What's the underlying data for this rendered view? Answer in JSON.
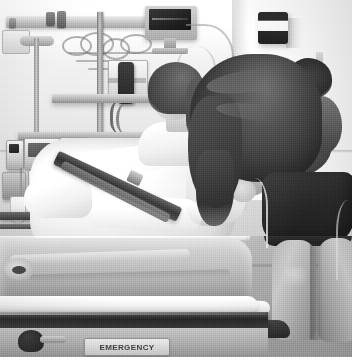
{
  "image": {
    "kind": "photograph",
    "medium": "black-and-white grainy print",
    "setting": "hospital emergency room / trauma bay",
    "orientation": "portrait",
    "width_px": 358,
    "height_px": 363,
    "palette": {
      "paper_white": "#ffffff",
      "wall_light": "#f3f2ef",
      "wall_mid": "#d6d3cd",
      "linen_white": "#fbfaf7",
      "mattress_gray": "#c0bdb6",
      "frame_dark": "#2a2826",
      "hair_dark": "#2f2d2a",
      "skin_mid": "#c3bbb0",
      "floor_gray": "#a8a5a0"
    }
  },
  "subjects": {
    "patient": {
      "name": "patient-in-gurney",
      "description": "young patient sitting upright in the gurney, head tilted down, wrapped in white linens"
    },
    "caregiver": {
      "name": "woman-bending-over-patient",
      "description": "woman with long dark wavy hair leaning over the gurney, wearing a gray top and dark shorts"
    }
  },
  "scene_objects": {
    "wall_monitor": "patient-monitor-on-wall-mount",
    "wall_dispenser": "wall-mounted-glove-dispenser",
    "suction_canister": "suction-regulator-canister",
    "handset": "black-wall-handset",
    "iv_poles": "iv-poles",
    "infusion_pumps": "infusion-pump-stack",
    "iv_bags": "hanging-iv-bags",
    "equipment_shelf": "wall-equipment-shelf",
    "gurney": "emergency-gurney",
    "mattress": "gurney-mattress",
    "blankets": "white-blankets-and-pillows",
    "strap": "dark-gurney-restraint-strap",
    "floor": "tiled-floor"
  },
  "labels": {
    "gurney_plate": "EMERGENCY"
  }
}
